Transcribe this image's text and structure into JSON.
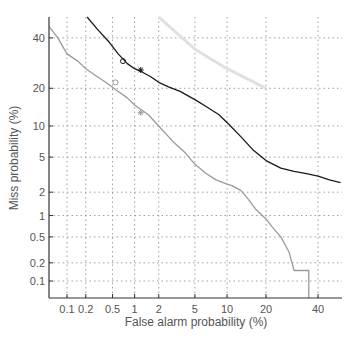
{
  "chart_data": {
    "type": "line",
    "subtype": "DET curve (normal deviate scale)",
    "title": "",
    "xlabel": "False alarm probability (%)",
    "ylabel": "Miss probability (%)",
    "x_ticks": [
      "0.1",
      "0.2",
      "0.5",
      "1",
      "2",
      "5",
      "10",
      "20",
      "40"
    ],
    "x_tick_values": [
      0.1,
      0.2,
      0.5,
      1,
      2,
      5,
      10,
      20,
      40
    ],
    "y_ticks": [
      "0.1",
      "0.2",
      "0.5",
      "1",
      "2",
      "5",
      "10",
      "20",
      "40"
    ],
    "y_tick_values": [
      0.1,
      0.2,
      0.5,
      1,
      2,
      5,
      10,
      20,
      40
    ],
    "grid": true,
    "legend": null,
    "series": [
      {
        "name": "system A (dark)",
        "color": "#1a1a1a",
        "x": [
          0.21,
          0.3,
          0.45,
          0.6,
          0.8,
          1.0,
          1.2,
          1.6,
          2.0,
          2.6,
          3.5,
          5.0,
          6.5,
          8.5,
          10.5,
          13,
          16,
          20,
          25,
          30,
          35,
          40,
          45,
          50
        ],
        "y": [
          50,
          44,
          38,
          33,
          29,
          27,
          26,
          24,
          22,
          20.5,
          19,
          16.5,
          14.5,
          12.5,
          10.2,
          8,
          6,
          4.6,
          3.8,
          3.5,
          3.3,
          3.1,
          2.8,
          2.6
        ]
      },
      {
        "name": "system B (gray)",
        "color": "#9a9a9a",
        "x": [
          0.05,
          0.07,
          0.1,
          0.15,
          0.2,
          0.3,
          0.4,
          0.6,
          0.8,
          1.0,
          1.5,
          2.0,
          3.0,
          4.0,
          5.0,
          6.5,
          8.0,
          10,
          11,
          13,
          15,
          17,
          20,
          22,
          25,
          28,
          30,
          33,
          33,
          36,
          36
        ],
        "y": [
          45,
          40,
          33,
          30,
          27,
          24,
          22,
          19,
          17,
          15,
          12.5,
          10,
          7,
          5.5,
          4.2,
          3.3,
          2.8,
          2.5,
          2.4,
          2.1,
          1.6,
          1.2,
          0.9,
          0.7,
          0.5,
          0.3,
          0.15,
          0.15,
          0.15,
          0.15,
          0.01
        ]
      },
      {
        "name": "faint reference line",
        "color": "#e0e0e0",
        "x": [
          2.0,
          5.0,
          10,
          20
        ],
        "y": [
          50,
          35,
          27,
          20
        ]
      }
    ],
    "markers": [
      {
        "series": "system A (dark)",
        "x": 0.7,
        "y": 30,
        "symbol": "o"
      },
      {
        "series": "system A (dark)",
        "x": 1.2,
        "y": 26.5,
        "symbol": "*"
      },
      {
        "series": "system B (gray)",
        "x": 0.55,
        "y": 22,
        "symbol": "o"
      },
      {
        "series": "system B (gray)",
        "x": 1.2,
        "y": 13,
        "symbol": "*"
      }
    ],
    "xlim": [
      0.05,
      55
    ],
    "ylim": [
      0.01,
      55
    ]
  }
}
